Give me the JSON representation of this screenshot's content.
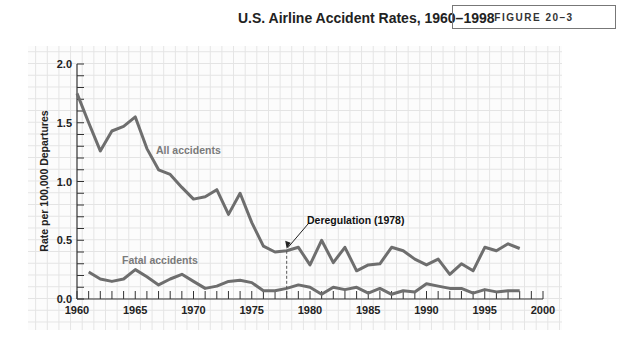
{
  "header": {
    "title": "U.S. Airline Accident Rates, 1960–1998",
    "figure_label": "FIGURE 20–3"
  },
  "chart_data": {
    "type": "line",
    "title": "U.S. Airline Accident Rates, 1960–1998",
    "xlabel": "",
    "ylabel": "Rate per 100,000 Departures",
    "xlim": [
      1960,
      2000
    ],
    "ylim": [
      0,
      2.0
    ],
    "x_ticks": [
      "1960",
      "1965",
      "1970",
      "1975",
      "1980",
      "1985",
      "1990",
      "1995",
      "2000"
    ],
    "y_ticks": [
      "0.0",
      "0.5",
      "1.0",
      "1.5",
      "2.0"
    ],
    "grid": true,
    "legend": "inline labels",
    "series": [
      {
        "name": "All accidents",
        "x": [
          1960,
          1961,
          1962,
          1963,
          1964,
          1965,
          1966,
          1967,
          1968,
          1969,
          1970,
          1971,
          1972,
          1973,
          1974,
          1975,
          1976,
          1977,
          1978,
          1979,
          1980,
          1981,
          1982,
          1983,
          1984,
          1985,
          1986,
          1987,
          1988,
          1989,
          1990,
          1991,
          1992,
          1993,
          1994,
          1995,
          1996,
          1997,
          1998
        ],
        "values": [
          1.75,
          1.5,
          1.26,
          1.43,
          1.47,
          1.55,
          1.28,
          1.1,
          1.06,
          0.95,
          0.85,
          0.87,
          0.93,
          0.72,
          0.9,
          0.65,
          0.45,
          0.4,
          0.41,
          0.44,
          0.29,
          0.5,
          0.31,
          0.44,
          0.24,
          0.29,
          0.3,
          0.44,
          0.41,
          0.34,
          0.29,
          0.34,
          0.21,
          0.3,
          0.24,
          0.44,
          0.41,
          0.47,
          0.43
        ]
      },
      {
        "name": "Fatal accidents",
        "x": [
          1961,
          1962,
          1963,
          1964,
          1965,
          1966,
          1967,
          1968,
          1969,
          1970,
          1971,
          1972,
          1973,
          1974,
          1975,
          1976,
          1977,
          1978,
          1979,
          1980,
          1981,
          1982,
          1983,
          1984,
          1985,
          1986,
          1987,
          1988,
          1989,
          1990,
          1991,
          1992,
          1993,
          1994,
          1995,
          1996,
          1997,
          1998
        ],
        "values": [
          0.23,
          0.17,
          0.15,
          0.17,
          0.25,
          0.19,
          0.12,
          0.17,
          0.21,
          0.15,
          0.09,
          0.11,
          0.15,
          0.16,
          0.14,
          0.07,
          0.07,
          0.09,
          0.12,
          0.1,
          0.04,
          0.1,
          0.08,
          0.1,
          0.05,
          0.09,
          0.04,
          0.07,
          0.06,
          0.13,
          0.11,
          0.09,
          0.09,
          0.05,
          0.08,
          0.06,
          0.07,
          0.07
        ]
      }
    ],
    "annotations": [
      {
        "text": "Deregulation (1978)",
        "x": 1978,
        "style": "dashed vertical line with arrow"
      },
      {
        "text": "All accidents",
        "label_for": "All accidents"
      },
      {
        "text": "Fatal accidents",
        "label_for": "Fatal accidents"
      }
    ]
  },
  "plot": {
    "ylabel": "Rate per 100,000 Departures",
    "labels": {
      "all": "All accidents",
      "fatal": "Fatal accidents",
      "deregulation": "Deregulation (1978)"
    },
    "colors": {
      "line": "#6e6e6e",
      "label": "#7a7a7a",
      "axis": "#333333"
    }
  }
}
